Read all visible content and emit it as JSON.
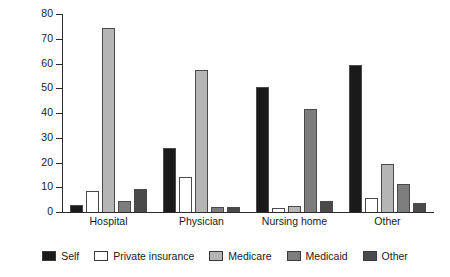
{
  "chart_data": {
    "type": "bar",
    "title": "",
    "xlabel": "",
    "ylabel": "Percentage of total",
    "ylim": [
      0,
      80
    ],
    "ytick_step": 10,
    "yticks": [
      "0",
      "10",
      "20",
      "30",
      "40",
      "50",
      "60",
      "70",
      "80"
    ],
    "grid": false,
    "legend_position": "bottom",
    "categories": [
      "Hospital",
      "Physician",
      "Nursing home",
      "Other"
    ],
    "series": [
      {
        "name": "Self",
        "color": "#1a1a1a",
        "values": [
          3.0,
          26.0,
          50.5,
          59.5
        ]
      },
      {
        "name": "Private insurance",
        "color": "#ffffff",
        "values": [
          8.5,
          14.0,
          1.5,
          5.5
        ]
      },
      {
        "name": "Medicare",
        "color": "#b5b5b5",
        "values": [
          74.5,
          57.5,
          2.5,
          19.5
        ]
      },
      {
        "name": "Medicaid",
        "color": "#7d7d7d",
        "values": [
          4.5,
          2.0,
          41.5,
          11.5
        ]
      },
      {
        "name": "Other",
        "color": "#4a4a4a",
        "values": [
          9.5,
          2.0,
          4.5,
          3.5
        ]
      }
    ]
  }
}
